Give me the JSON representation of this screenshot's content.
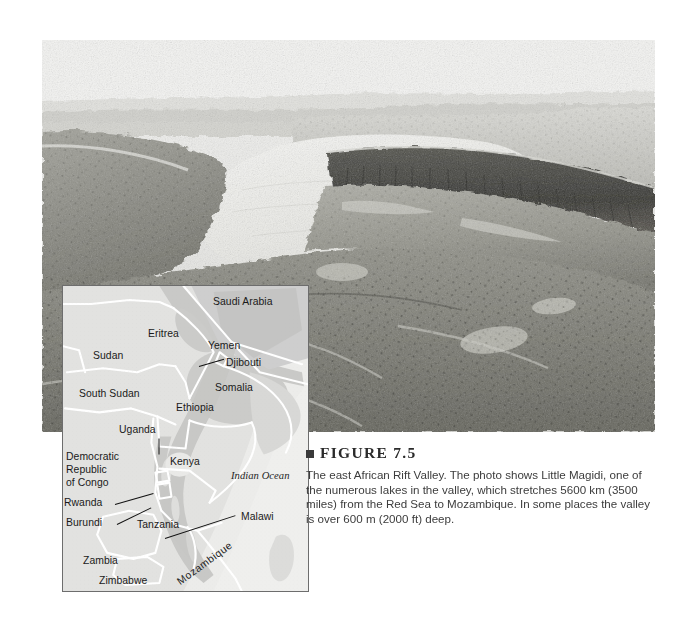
{
  "figure": {
    "bullet_icon": "filled-square-icon",
    "title": "FIGURE 7.5",
    "caption": "The east African Rift Valley. The photo shows Little Magidi, one of the numerous lakes in the valley, which stretches 5600 km (3500 miles) from the Red Sea to Mozambique. In some places the valley is over 600 m (2000 ft) deep."
  },
  "photo": {
    "alt": "Aerial black-and-white photograph of the east African Rift Valley showing Little Magidi lake and a steep escarpment",
    "credit": "©Emory Kristof/National Geographic Stock"
  },
  "map": {
    "title": "East African Rift Valley locator map",
    "ocean_label": "Indian Ocean",
    "labels": [
      {
        "name": "Saudi Arabia",
        "x": 150,
        "y": 12
      },
      {
        "name": "Eritrea",
        "x": 85,
        "y": 44
      },
      {
        "name": "Yemen",
        "x": 145,
        "y": 56
      },
      {
        "name": "Djibouti",
        "x": 162,
        "y": 75
      },
      {
        "name": "Sudan",
        "x": 30,
        "y": 67
      },
      {
        "name": "Somalia",
        "x": 152,
        "y": 98
      },
      {
        "name": "South Sudan",
        "x": 17,
        "y": 105
      },
      {
        "name": "Ethiopia",
        "x": 113,
        "y": 118
      },
      {
        "name": "Uganda",
        "x": 56,
        "y": 140
      },
      {
        "name": "Democratic",
        "x": 4,
        "y": 168
      },
      {
        "name": "Republic",
        "x": 4,
        "y": 180
      },
      {
        "name": "of Congo",
        "x": 4,
        "y": 192
      },
      {
        "name": "Kenya",
        "x": 107,
        "y": 172
      },
      {
        "name": "Rwanda",
        "x": 2,
        "y": 214
      },
      {
        "name": "Burundi",
        "x": 4,
        "y": 234
      },
      {
        "name": "Tanzania",
        "x": 74,
        "y": 236
      },
      {
        "name": "Malawi",
        "x": 172,
        "y": 228
      },
      {
        "name": "Zambia",
        "x": 20,
        "y": 272
      },
      {
        "name": "Zimbabwe",
        "x": 36,
        "y": 292
      },
      {
        "name": "Mozambique",
        "x": 110,
        "y": 258
      }
    ]
  },
  "colors": {
    "map_land": "#e0e0de",
    "map_highland": "#c4c4c2",
    "map_border_line": "#ffffff",
    "map_frame": "#6d6d6d",
    "figure_bullet": "#3a3a3a",
    "caption_text": "#3c3c3c",
    "page_background": "#ffffff"
  }
}
